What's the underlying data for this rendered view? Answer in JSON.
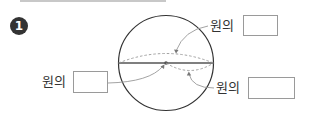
{
  "problem": {
    "number": "1"
  },
  "diagram": {
    "shape": "circle",
    "labels": [
      {
        "id": "top",
        "text": "원의",
        "answer": ""
      },
      {
        "id": "left",
        "text": "원의",
        "answer": ""
      },
      {
        "id": "bottom_right",
        "text": "원의",
        "answer": ""
      }
    ]
  },
  "colors": {
    "stroke": "#333333",
    "dashed": "#999999",
    "box_border": "#9a9a9a",
    "badge": "#333333"
  }
}
